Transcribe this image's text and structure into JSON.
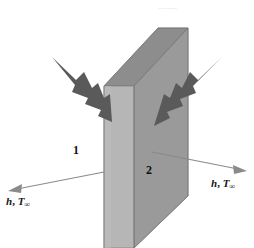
{
  "figure": {
    "background": "#ffffff",
    "width": 254,
    "height": 248
  },
  "slab": {
    "front_face_color": "#b6b6b6",
    "top_face_color": "#8d8d8d",
    "side_face_color": "#9a9a9a",
    "edge_color": "#7d7d7d"
  },
  "heat_arrows": {
    "color": "#5a5a5a",
    "left": {
      "name": "left-heat-flux-arrow",
      "direction": "up-left"
    },
    "right": {
      "name": "right-heat-flux-arrow",
      "direction": "up-right"
    }
  },
  "convection": {
    "line_color": "#8a8a8a",
    "left": {
      "label_h": "h",
      "label_comma": ",",
      "label_T": "T",
      "label_sub": "∞",
      "direction": "left"
    },
    "right": {
      "label_h": "h",
      "label_comma": ",",
      "label_T": "T",
      "label_sub": "∞",
      "direction": "right"
    }
  },
  "surfaces": {
    "left_label": "1",
    "right_label": "2"
  },
  "artifact": {
    "top_text": "——"
  }
}
